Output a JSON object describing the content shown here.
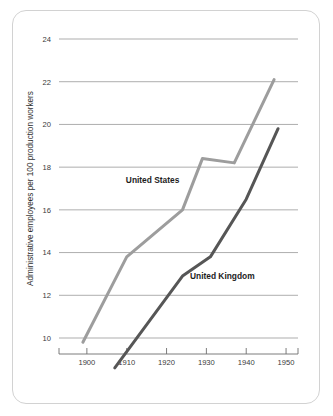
{
  "card": {
    "background_color": "#ffffff",
    "border_color": "#d2d2d2"
  },
  "chart_data": {
    "type": "line",
    "title": "",
    "subtitle": "",
    "xlabel": "",
    "ylabel": "Administrative employees per 100 production workers",
    "xlim": [
      1893,
      1953
    ],
    "ylim": [
      8.2,
      24.6
    ],
    "xticks": [
      1900,
      1910,
      1920,
      1930,
      1940,
      1950
    ],
    "xtick_labels": [
      "1900",
      "1910",
      "1920",
      "1930",
      "1940",
      "1950"
    ],
    "yticks": [
      10,
      12,
      14,
      16,
      18,
      20,
      22,
      24
    ],
    "ytick_labels": [
      "10",
      "12",
      "14",
      "16",
      "18",
      "20",
      "22",
      "24"
    ],
    "grid": "horizontal",
    "legend_position": "inline-annotation",
    "series": [
      {
        "name": "United States",
        "color": "#9d9d9d",
        "line_width": 3.0,
        "label_x": 1916.5,
        "label_y": 17.25,
        "x": [
          1899,
          1910,
          1924,
          1929,
          1937,
          1947
        ],
        "values": [
          9.8,
          13.8,
          16.0,
          18.4,
          18.2,
          22.1
        ]
      },
      {
        "name": "United Kingdom",
        "color": "#565656",
        "line_width": 3.0,
        "label_x": 1934.0,
        "label_y": 12.75,
        "x": [
          1907,
          1924,
          1931,
          1940,
          1948
        ],
        "values": [
          8.6,
          12.9,
          13.8,
          16.5,
          19.8
        ]
      }
    ]
  }
}
